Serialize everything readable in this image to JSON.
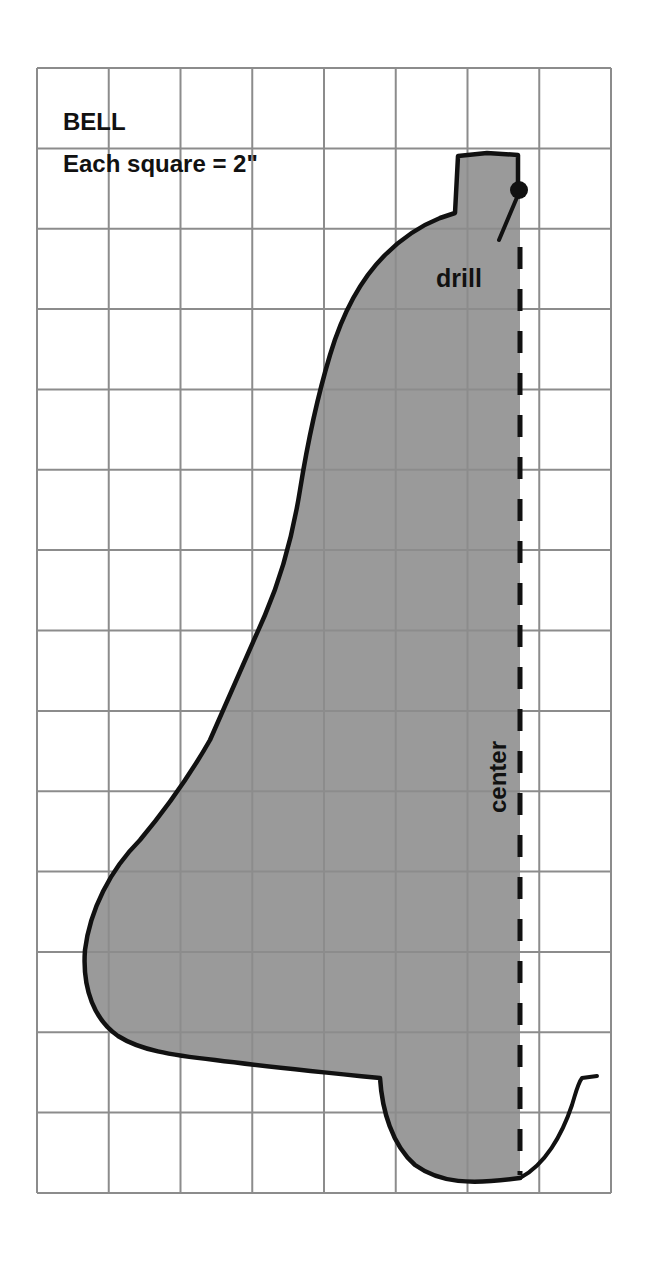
{
  "diagram": {
    "title": "BELL",
    "scale_label": "Each square = 2\"",
    "drill_label": "drill",
    "center_label": "center",
    "colors": {
      "grid": "#8c8c8c",
      "fill": "#9a9a9a",
      "outline": "#111111",
      "background": "#ffffff"
    },
    "grid": {
      "columns": 8,
      "rows": 14,
      "square_size_inches": 2
    }
  }
}
